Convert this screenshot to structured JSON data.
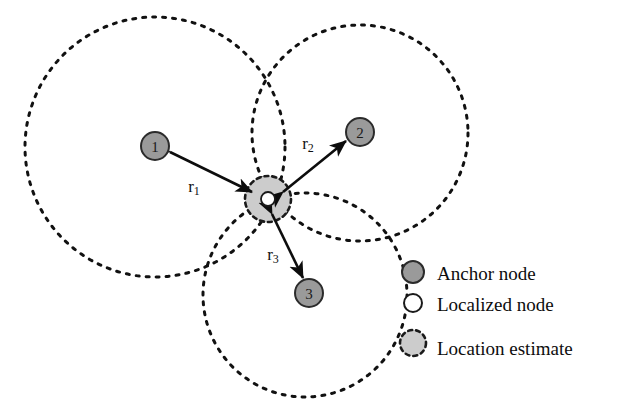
{
  "figure": {
    "background_color": "#ffffff"
  },
  "colors": {
    "anchor_fill": "#9a9a9a",
    "anchor_stroke": "#2b2b2b",
    "estimate_fill": "#cccccc",
    "estimate_stroke": "#1a1a1a",
    "localized_fill": "#ffffff",
    "localized_stroke": "#1a1a1a",
    "range_circle_stroke": "#111111",
    "arrow_color": "#0d0d0d",
    "text_color": "#0d0d0d"
  },
  "anchors": [
    {
      "id": "anchor-1",
      "label": "1",
      "cx": 155,
      "cy": 146,
      "r": 14,
      "range_circle": {
        "cx": 155,
        "cy": 147,
        "r": 130
      },
      "range_label": {
        "text": "r",
        "subscript": "1",
        "x": 194,
        "y": 186
      }
    },
    {
      "id": "anchor-2",
      "label": "2",
      "cx": 360,
      "cy": 132,
      "r": 14,
      "range_circle": {
        "cx": 360,
        "cy": 133,
        "r": 108
      },
      "range_label": {
        "text": "r",
        "subscript": "2",
        "x": 308,
        "y": 143
      }
    },
    {
      "id": "anchor-3",
      "label": "3",
      "cx": 309,
      "cy": 293,
      "r": 14,
      "range_circle": {
        "cx": 305,
        "cy": 295,
        "r": 102
      },
      "range_label": {
        "text": "r",
        "subscript": "3",
        "x": 273,
        "y": 254
      }
    }
  ],
  "estimate_region": {
    "id": "location-estimate-region",
    "cx": 268,
    "cy": 199,
    "r": 23
  },
  "localized_node": {
    "id": "localized-node",
    "cx": 268,
    "cy": 199,
    "r": 7
  },
  "legend": {
    "items": [
      {
        "key": "anchor",
        "label": "Anchor node",
        "swatch": "filled-gray-circle",
        "cx": 413,
        "cy": 272,
        "r": 11
      },
      {
        "key": "localized",
        "label": "Localized node",
        "swatch": "hollow-circle",
        "cx": 413,
        "cy": 303,
        "r": 9
      },
      {
        "key": "estimate",
        "label": "Location estimate",
        "swatch": "dashed-gray-circle",
        "cx": 413,
        "cy": 343,
        "r": 13
      }
    ],
    "text_x": 437
  }
}
